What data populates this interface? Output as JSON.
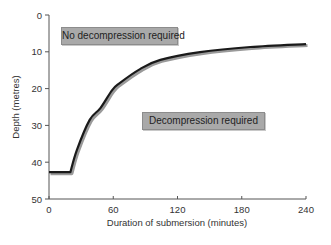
{
  "chart_data": {
    "type": "line",
    "title": "",
    "xlabel": "Duration of submersion (minutes)",
    "ylabel": "Depth (metres)",
    "xlim": [
      0,
      240
    ],
    "ylim": [
      0,
      50
    ],
    "y_inverted": true,
    "grid": false,
    "x_ticks": [
      0,
      60,
      120,
      180,
      240
    ],
    "y_ticks": [
      0,
      10,
      20,
      30,
      40,
      50
    ],
    "series": [
      {
        "name": "Decompression limit",
        "x": [
          0,
          20,
          26,
          38,
          48,
          59,
          66,
          85,
          104,
          141,
          188,
          240
        ],
        "y": [
          42.7,
          42.7,
          36.7,
          28.5,
          25.3,
          20.4,
          18.5,
          14.7,
          12.2,
          10.1,
          8.7,
          7.9
        ]
      }
    ],
    "annotations": [
      {
        "text": "No decompression required",
        "region": "above curve"
      },
      {
        "text": "Decompression required",
        "region": "below curve"
      }
    ],
    "colors": {
      "line": "#1a1a1a",
      "line_shadow": "#9a9a9a",
      "label_bg": "#a9a9a9",
      "axis": "#555555"
    }
  },
  "labels": {
    "no_decompression": "No decompression required",
    "decompression": "Decompression required"
  },
  "axes": {
    "xlabel": "Duration of submersion (minutes)",
    "ylabel": "Depth (metres)",
    "x_tick_labels": [
      "0",
      "60",
      "120",
      "180",
      "240"
    ],
    "y_tick_labels": [
      "0",
      "10",
      "20",
      "30",
      "40",
      "50"
    ]
  }
}
